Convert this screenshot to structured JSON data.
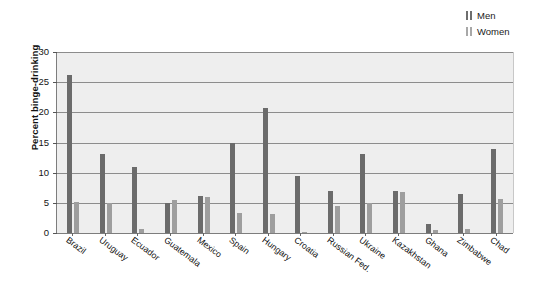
{
  "chart_data": {
    "type": "bar",
    "title": "",
    "subtitle": "",
    "xlabel": "",
    "ylabel": "Percent binge-drinking",
    "ylim": [
      0,
      30
    ],
    "yticks": [
      0,
      5,
      10,
      15,
      20,
      25,
      30
    ],
    "grid": true,
    "legend_position": "top-right",
    "categories": [
      "Brazil",
      "Uruguay",
      "Ecuador",
      "Guatemala",
      "Mexico",
      "Spain",
      "Hungary",
      "Croatia",
      "Russian Fed.",
      "Ukraine",
      "Kazakhstan",
      "Ghana",
      "Zimbabwe",
      "Chad"
    ],
    "series": [
      {
        "name": "Men",
        "color": "#6b6b6b",
        "values": [
          26.2,
          13.1,
          11.0,
          5.0,
          6.1,
          15.0,
          20.8,
          9.4,
          6.9,
          13.1,
          6.9,
          1.5,
          6.4,
          13.9
        ]
      },
      {
        "name": "Women",
        "color": "#9e9e9e",
        "values": [
          5.1,
          5.0,
          0.6,
          5.4,
          6.0,
          3.3,
          3.2,
          0.2,
          4.5,
          5.0,
          6.8,
          0.5,
          0.7,
          5.6
        ]
      }
    ]
  },
  "legend": {
    "items": [
      {
        "label": "Men",
        "swatch": "men"
      },
      {
        "label": "Women",
        "swatch": "women"
      }
    ]
  },
  "axis": {
    "y_title": "Percent binge-drinking"
  },
  "colors": {
    "men": "#6b6b6b",
    "women": "#9e9e9e",
    "plot_background": "#eeeeee",
    "gridline": "#8c8c8c",
    "axis": "#7d7d7d"
  }
}
